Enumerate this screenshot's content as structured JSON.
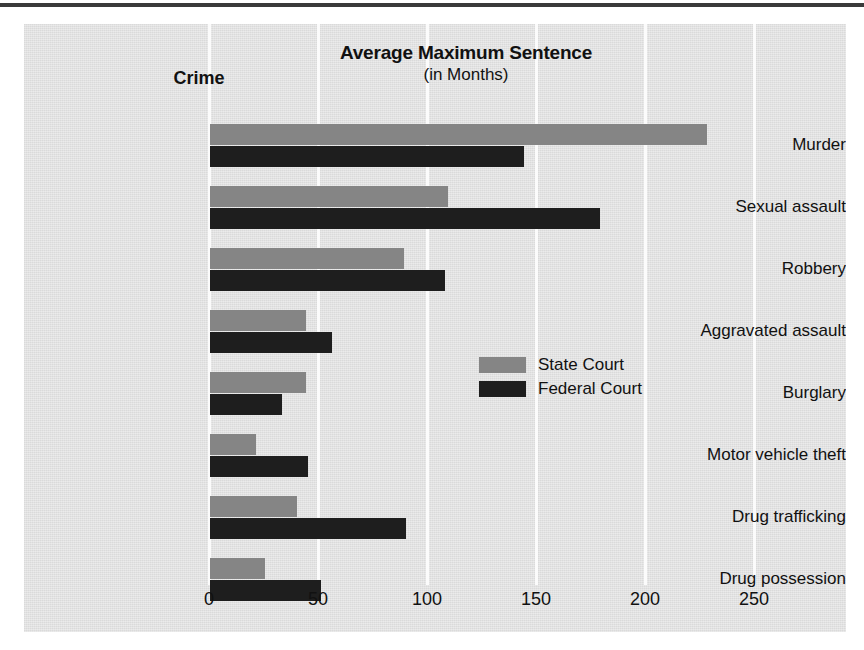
{
  "chart_data": {
    "type": "bar",
    "orientation": "horizontal",
    "title": "Average Maximum Sentence",
    "subtitle": "(in Months)",
    "category_axis_header": "Crime",
    "xlabel": "",
    "ylabel": "",
    "xlim": [
      0,
      275
    ],
    "xticks": [
      0,
      50,
      100,
      150,
      200,
      250
    ],
    "xtick_labels": [
      "0",
      "50",
      "100",
      "150",
      "200",
      "250"
    ],
    "grid": true,
    "legend_position": "right-middle",
    "categories": [
      "Murder",
      "Sexual assault",
      "Robbery",
      "Aggravated assault",
      "Burglary",
      "Motor vehicle theft",
      "Drug trafficking",
      "Drug possession"
    ],
    "series": [
      {
        "name": "State Court",
        "color": "#858585",
        "values": [
          228,
          109,
          89,
          44,
          44,
          21,
          40,
          25
        ]
      },
      {
        "name": "Federal Court",
        "color": "#1e1e1e",
        "values": [
          144,
          179,
          108,
          56,
          33,
          45,
          90,
          51
        ]
      }
    ]
  },
  "colors": {
    "panel_background": "#e2e2e2",
    "gridline": "#fbfbfb",
    "top_rule": "#3a3a3a",
    "text": "#111111",
    "state_court": "#858585",
    "federal_court": "#1e1e1e"
  }
}
